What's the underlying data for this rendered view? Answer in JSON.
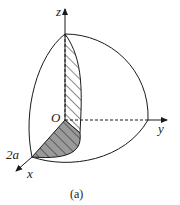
{
  "figure": {
    "caption": "(a)",
    "labels": {
      "z": "z",
      "y": "y",
      "x": "x",
      "origin": "O",
      "radius_mark": "2a"
    },
    "colors": {
      "stroke": "#1a1a1a",
      "shaded_fill": "#9a9a9a",
      "background": "#ffffff"
    }
  }
}
